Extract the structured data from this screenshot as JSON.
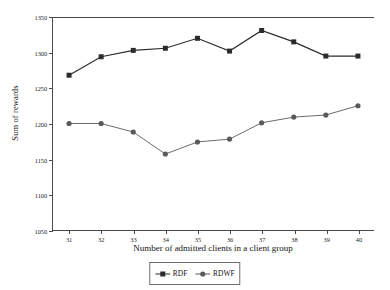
{
  "chart_data": {
    "type": "line",
    "title": "",
    "xlabel": "Number of admitted clients in a client group",
    "ylabel": "Sum of rewards",
    "x": [
      31,
      32,
      33,
      34,
      35,
      36,
      37,
      38,
      39,
      40
    ],
    "categories": [
      "31",
      "32",
      "33",
      "34",
      "35",
      "36",
      "37",
      "38",
      "39",
      "40"
    ],
    "xlim": [
      30.5,
      40.5
    ],
    "ylim": [
      1050,
      1350
    ],
    "yticks": [
      1050,
      1100,
      1150,
      1200,
      1250,
      1300,
      1350
    ],
    "ytick_labels": [
      "1050",
      "1100",
      "1150",
      "1200",
      "1250",
      "1300",
      "1350"
    ],
    "xticks": [
      31,
      32,
      33,
      34,
      35,
      36,
      37,
      38,
      39,
      40
    ],
    "xtick_labels": [
      "31",
      "32",
      "33",
      "34",
      "35",
      "36",
      "37",
      "38",
      "39",
      "40"
    ],
    "grid": false,
    "legend_position": "bottom-center",
    "series": [
      {
        "name": "RDF",
        "marker": "square",
        "color": "#2b2b2b",
        "values": [
          1268,
          1294,
          1303,
          1306,
          1320,
          1302,
          1331,
          1315,
          1295,
          1295
        ]
      },
      {
        "name": "RDWF",
        "marker": "circle",
        "color": "#5a5a5a",
        "values": [
          1200,
          1200,
          1188,
          1157,
          1174,
          1178,
          1201,
          1209,
          1212,
          1225
        ]
      }
    ]
  },
  "legend": {
    "items": [
      {
        "label": "RDF",
        "marker": "square-marker-icon"
      },
      {
        "label": "RDWF",
        "marker": "circle-marker-icon"
      }
    ]
  },
  "colors": {
    "axis": "#4a4a4a",
    "series_rdf": "#2b2b2b",
    "series_rdwf": "#5a5a5a",
    "background": "#ffffff",
    "text": "#141414"
  }
}
